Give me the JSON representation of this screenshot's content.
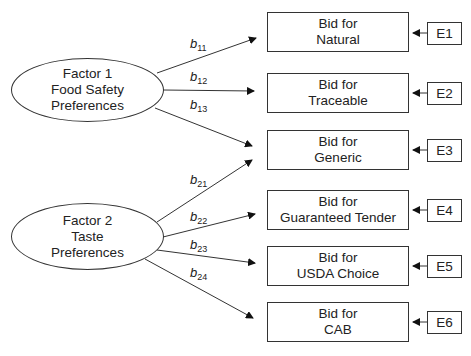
{
  "factors": [
    {
      "lines": [
        "Factor 1",
        "Food Safety",
        "Preferences"
      ]
    },
    {
      "lines": [
        "Factor 2",
        "Taste",
        "Preferences"
      ]
    }
  ],
  "indicators": [
    {
      "line1": "Bid for",
      "line2": "Natural",
      "error": "E1"
    },
    {
      "line1": "Bid for",
      "line2": "Traceable",
      "error": "E2"
    },
    {
      "line1": "Bid for",
      "line2": "Generic",
      "error": "E3"
    },
    {
      "line1": "Bid for",
      "line2": "Guaranteed Tender",
      "error": "E4"
    },
    {
      "line1": "Bid for",
      "line2": "USDA Choice",
      "error": "E5"
    },
    {
      "line1": "Bid for",
      "line2": "CAB",
      "error": "E6"
    }
  ],
  "paths": [
    {
      "base": "b",
      "sub": "11"
    },
    {
      "base": "b",
      "sub": "12"
    },
    {
      "base": "b",
      "sub": "13"
    },
    {
      "base": "b",
      "sub": "21"
    },
    {
      "base": "b",
      "sub": "22"
    },
    {
      "base": "b",
      "sub": "23"
    },
    {
      "base": "b",
      "sub": "24"
    }
  ]
}
